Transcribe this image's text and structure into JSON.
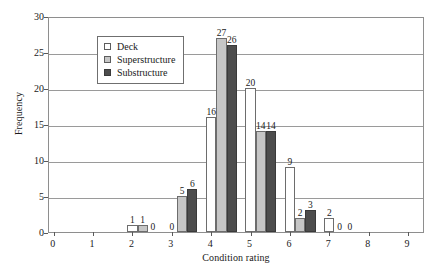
{
  "chart_data": {
    "type": "bar",
    "title": "",
    "xlabel": "Condition rating",
    "ylabel": "Frequency",
    "categories": [
      "0",
      "1",
      "2",
      "3",
      "4",
      "5",
      "6",
      "7",
      "8",
      "9"
    ],
    "xlim": [
      0,
      9
    ],
    "ylim": [
      0,
      30
    ],
    "yticks": [
      0,
      5,
      10,
      15,
      20,
      25,
      30
    ],
    "grid": true,
    "legend_position": "upper-left-inside",
    "series": [
      {
        "name": "Deck",
        "color": "#ffffff",
        "values": [
          0,
          0,
          1,
          0,
          16,
          20,
          9,
          2,
          0,
          0
        ]
      },
      {
        "name": "Superstructure",
        "color": "#c6c6c6",
        "values": [
          0,
          0,
          1,
          5,
          27,
          14,
          2,
          0,
          0,
          0
        ]
      },
      {
        "name": "Substructure",
        "color": "#4d4d4d",
        "values": [
          0,
          0,
          0,
          6,
          26,
          14,
          3,
          0,
          0,
          0
        ]
      }
    ],
    "visible_bar_labels": [
      {
        "category": "2",
        "series": "Deck",
        "text": "1"
      },
      {
        "category": "2",
        "series": "Superstructure",
        "text": "1"
      },
      {
        "category": "2",
        "series": "Substructure",
        "text": "0"
      },
      {
        "category": "3",
        "series": "Deck",
        "text": "0"
      },
      {
        "category": "3",
        "series": "Superstructure",
        "text": "5"
      },
      {
        "category": "3",
        "series": "Substructure",
        "text": "6"
      },
      {
        "category": "4",
        "series": "Deck",
        "text": "16"
      },
      {
        "category": "4",
        "series": "Superstructure",
        "text": "27"
      },
      {
        "category": "4",
        "series": "Substructure",
        "text": "26"
      },
      {
        "category": "5",
        "series": "Deck",
        "text": "20"
      },
      {
        "category": "5",
        "series": "Superstructure",
        "text": "14"
      },
      {
        "category": "5",
        "series": "Substructure",
        "text": "14"
      },
      {
        "category": "6",
        "series": "Deck",
        "text": "9"
      },
      {
        "category": "6",
        "series": "Superstructure",
        "text": "2"
      },
      {
        "category": "6",
        "series": "Substructure",
        "text": "3"
      },
      {
        "category": "7",
        "series": "Deck",
        "text": "2"
      },
      {
        "category": "7",
        "series": "Superstructure",
        "text": "0"
      },
      {
        "category": "7",
        "series": "Substructure",
        "text": "0"
      }
    ]
  },
  "axes": {
    "y_title": "Frequency",
    "x_title": "Condition rating",
    "y_tick_labels": [
      "0",
      "5",
      "10",
      "15",
      "20",
      "25",
      "30"
    ],
    "x_tick_labels": [
      "0",
      "1",
      "2",
      "3",
      "4",
      "5",
      "6",
      "7",
      "8",
      "9"
    ]
  },
  "legend": {
    "items": [
      {
        "label": "Deck",
        "swatch": "deck"
      },
      {
        "label": "Superstructure",
        "swatch": "superstructure"
      },
      {
        "label": "Substructure",
        "swatch": "substructure"
      }
    ]
  },
  "colors": {
    "deck": "#ffffff",
    "superstructure": "#c6c6c6",
    "substructure": "#4d4d4d",
    "gridline": "#9a9a9a",
    "frame": "#8e8e8e",
    "text": "#1a1a1a"
  }
}
